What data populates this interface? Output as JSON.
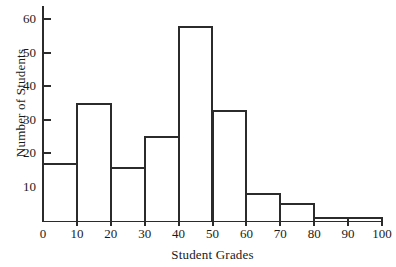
{
  "chart_data": {
    "type": "bar",
    "title": "",
    "xlabel": "Student Grades",
    "ylabel": "Number of Students",
    "categories": [
      "0-10",
      "10-20",
      "20-30",
      "30-40",
      "40-50",
      "50-60",
      "60-70",
      "70-80",
      "80-90",
      "90-100"
    ],
    "bin_edges": [
      0,
      10,
      20,
      30,
      40,
      50,
      60,
      70,
      80,
      90,
      100
    ],
    "values": [
      17,
      35,
      16,
      25,
      58,
      33,
      8,
      5,
      1,
      1
    ],
    "xlim": [
      0,
      100
    ],
    "ylim": [
      0,
      64
    ],
    "xticks": [
      "0",
      "10",
      "20",
      "30",
      "40",
      "50",
      "60",
      "70",
      "80",
      "90",
      "100"
    ],
    "xtick_values": [
      0,
      10,
      20,
      30,
      40,
      50,
      60,
      70,
      80,
      90,
      100
    ],
    "yticks": [
      "10",
      "20",
      "30",
      "40",
      "50",
      "60"
    ],
    "ytick_values": [
      10,
      20,
      30,
      40,
      50,
      60
    ],
    "grid": false,
    "legend": null,
    "bar_edge_color": "#2b2b2b",
    "bar_fill_color": "#ffffff",
    "axis_color": "#2b2b2b",
    "background_color": "#ffffff"
  }
}
